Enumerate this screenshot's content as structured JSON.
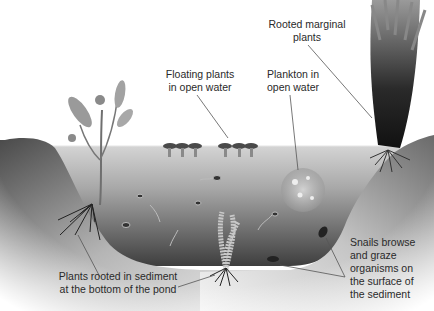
{
  "diagram": {
    "type": "pond cross-section",
    "labels": {
      "floating_plants": "Floating plants\nin open water",
      "plankton": "Plankton in\nopen water",
      "rooted_marginal": "Rooted marginal\nplants",
      "rooted_sediment": "Plants rooted in sediment\nat the bottom of the pond",
      "snails": "Snails browse\nand graze\norganisms on\nthe surface of\nthe sediment"
    },
    "colors": {
      "background": "#ffffff",
      "bank_dark": "#5a5a5a",
      "bank_light": "#e8e8e8",
      "water_top": "#c9c9c9",
      "water_bottom": "#4a4a4a",
      "sediment": "#d8d8d8",
      "leader_line": "#555555",
      "text": "#2a2a2a"
    }
  }
}
